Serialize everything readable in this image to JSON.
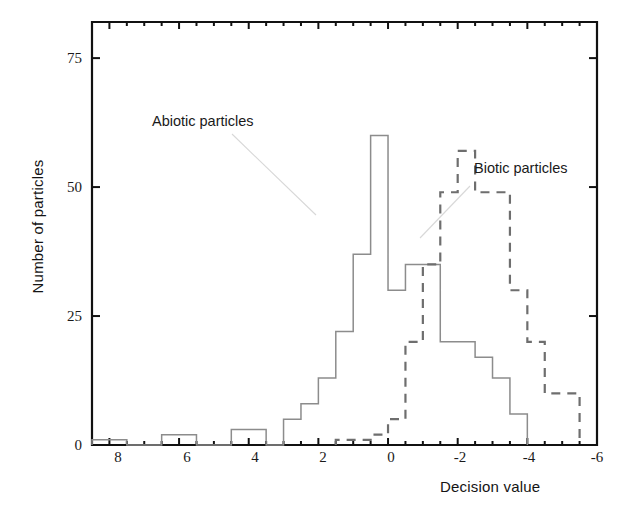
{
  "chart_data": {
    "type": "bar",
    "subtype": "step-histogram",
    "title": "",
    "xlabel": "Decision value",
    "ylabel": "Number of particles",
    "xlim": [
      8.5,
      -6.0
    ],
    "ylim": [
      0,
      82
    ],
    "x_axis_reversed": true,
    "grid": false,
    "legend_position": "inline-annotations",
    "bin_width": 0.5,
    "xticks": [
      8,
      6,
      4,
      2,
      0,
      -2,
      -4,
      -6
    ],
    "xtick_labels": [
      "8",
      "6",
      "4",
      "2",
      "0",
      "-2",
      "-4",
      "-6"
    ],
    "yticks": [
      0,
      25,
      50,
      75
    ],
    "ytick_labels": [
      "0",
      "25",
      "50",
      "75"
    ],
    "annotations": [
      {
        "text": "Abiotic particles",
        "x": 5.5,
        "y": 64
      },
      {
        "text": "Biotic particles",
        "x": -2.4,
        "y": 55
      }
    ],
    "series": [
      {
        "name": "Abiotic particles",
        "linestyle": "solid",
        "color": "#8c8c8c",
        "bin_left_edges": [
          8.5,
          8.0,
          7.5,
          7.0,
          6.5,
          6.0,
          5.5,
          5.0,
          4.5,
          4.0,
          3.5,
          3.0,
          2.5,
          2.0,
          1.5,
          1.0,
          0.5,
          0.0,
          -0.5,
          -1.0,
          -1.5,
          -2.0,
          -2.5,
          -3.0,
          -3.5
        ],
        "values": [
          1,
          1,
          0,
          0,
          2,
          2,
          0,
          0,
          3,
          3,
          0,
          5,
          8,
          13,
          22,
          37,
          60,
          30,
          35,
          35,
          20,
          20,
          17,
          13,
          6
        ]
      },
      {
        "name": "Biotic particles",
        "linestyle": "dashed",
        "color": "#6e6e6e",
        "bin_left_edges": [
          1.5,
          1.0,
          0.5,
          0.0,
          -0.5,
          -1.0,
          -1.5,
          -2.0,
          -2.5,
          -3.0,
          -3.5,
          -4.0,
          -4.5,
          -5.0
        ],
        "values": [
          1,
          1,
          2,
          5,
          20,
          35,
          49,
          57,
          49,
          49,
          30,
          20,
          10,
          10
        ]
      }
    ]
  },
  "axes": {
    "xlabel": "Decision value",
    "ylabel": "Number of particles"
  },
  "labels": {
    "abiotic": "Abiotic particles",
    "biotic": "Biotic particles"
  },
  "xticks": {
    "t0": "8",
    "t1": "6",
    "t2": "4",
    "t3": "2",
    "t4": "0",
    "t5": "-2",
    "t6": "-4",
    "t7": "-6"
  },
  "yticks": {
    "t0": "0",
    "t1": "25",
    "t2": "50",
    "t3": "75"
  },
  "colors": {
    "frame": "#111111",
    "abiotic_line": "#8c8c8c",
    "biotic_line": "#6e6e6e",
    "text": "#1a1a1a"
  }
}
